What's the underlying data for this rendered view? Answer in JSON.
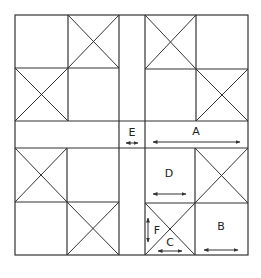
{
  "diagram": {
    "line_color": "#333333",
    "background": "#ffffff",
    "labels": [
      {
        "id": "E",
        "text": "E",
        "meaning": "width of vertical strip"
      },
      {
        "id": "A",
        "text": "A",
        "meaning": "horizontal span of quadrant"
      },
      {
        "id": "D",
        "text": "D",
        "meaning": "width of plain square"
      },
      {
        "id": "B",
        "text": "B",
        "meaning": "width of plain square"
      },
      {
        "id": "F",
        "text": "F",
        "meaning": "height of triangle"
      },
      {
        "id": "C",
        "text": "C",
        "meaning": "base of triangle"
      }
    ],
    "quadrants": [
      {
        "name": "top-left",
        "crossed_cells": [
          "top-right",
          "bottom-left"
        ]
      },
      {
        "name": "top-right",
        "crossed_cells": [
          "top-left",
          "bottom-right"
        ]
      },
      {
        "name": "bottom-left",
        "crossed_cells": [
          "top-left",
          "bottom-right"
        ]
      },
      {
        "name": "bottom-right",
        "crossed_cells": [
          "top-right",
          "bottom-left"
        ]
      }
    ]
  }
}
